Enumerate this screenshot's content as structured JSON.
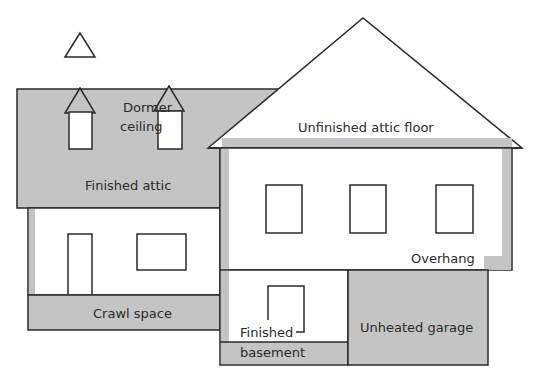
{
  "colors": {
    "fill_gray": "#c4c4c4",
    "stroke": "#2a2a2a",
    "background": "#ffffff"
  },
  "labels": {
    "dormer_line1": "Dormer",
    "dormer_line2": "ceiling",
    "finished_attic": "Finished attic",
    "unfinished_attic_floor": "Unfinished attic floor",
    "overhang": "Overhang",
    "crawl_space": "Crawl space",
    "finished_basement_line1": "Finished",
    "finished_basement_line2": "basement",
    "unheated_garage": "Unheated garage"
  }
}
